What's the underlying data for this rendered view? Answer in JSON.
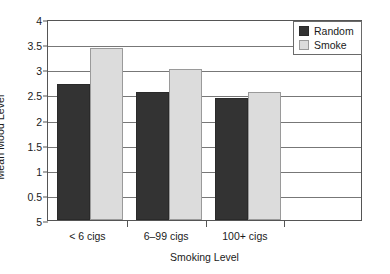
{
  "chart_data": {
    "type": "bar",
    "title": "",
    "subtitle": "",
    "xlabel": "Smoking Level",
    "ylabel": "Mean Mood Level",
    "categories": [
      "< 6 cigs",
      "6–99 cigs",
      "100+ cigs"
    ],
    "series": [
      {
        "name": "Random",
        "color": "#333333",
        "values": [
          2.7,
          2.54,
          2.43
        ]
      },
      {
        "name": "Smoke",
        "color": "#dcdcdc",
        "values": [
          3.42,
          3.0,
          2.54
        ]
      }
    ],
    "ylim": [
      0,
      4
    ],
    "ytick_values": [
      4,
      3.5,
      3,
      2.5,
      2,
      1.5,
      1,
      0.5,
      0
    ],
    "ytick_labels": [
      "4",
      "3.5",
      "3",
      "2.5",
      "2",
      "1.5",
      "1",
      "0.5",
      "5"
    ],
    "grid": true,
    "grid_axis": "y",
    "legend_position": "top-right",
    "legend_entries": [
      "Random",
      "Smoke"
    ],
    "bar_group_count": 4,
    "plot_bgcolor": "#ffffff",
    "frame_color": "#555555",
    "grid_color": "#777777"
  }
}
